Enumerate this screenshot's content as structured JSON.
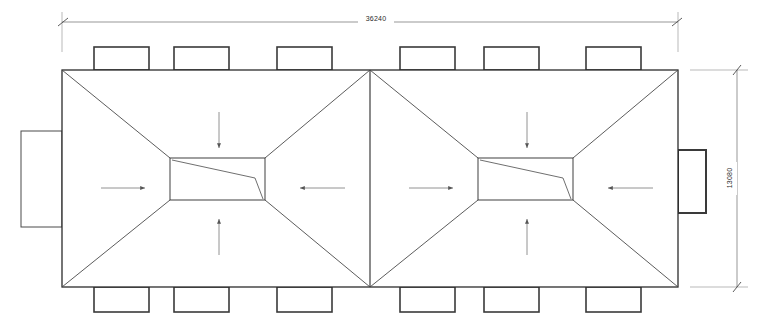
{
  "drawing": {
    "type": "architectural-roof-plan",
    "title": "Roof Plan",
    "line_color": "#2b2b2b",
    "heavy_line_color": "#3a3a3a",
    "background_color": "#ffffff",
    "dimensions": {
      "overall_width": {
        "value": "36240",
        "position": "top",
        "orientation": "horizontal"
      },
      "overall_height": {
        "value": "13080",
        "position": "right",
        "orientation": "vertical"
      }
    },
    "outline": {
      "x1": 62,
      "y1": 70,
      "x2": 678,
      "y2": 287
    },
    "center_valley_x": 370,
    "roof_sections": [
      {
        "name": "left-hip-roof",
        "outer": {
          "x1": 62,
          "y1": 70,
          "x2": 370,
          "y2": 287
        },
        "inner_flat": {
          "x1": 170,
          "y1": 158,
          "x2": 265,
          "y2": 200
        },
        "drain_line": {
          "x1": 172,
          "y1": 160,
          "x2": 255,
          "y2": 178,
          "x3": 263,
          "y3": 199
        }
      },
      {
        "name": "right-hip-roof",
        "outer": {
          "x1": 370,
          "y1": 70,
          "x2": 678,
          "y2": 287
        },
        "inner_flat": {
          "x1": 478,
          "y1": 158,
          "x2": 573,
          "y2": 200
        },
        "drain_line": {
          "x1": 480,
          "y1": 160,
          "x2": 563,
          "y2": 178,
          "x3": 571,
          "y3": 199
        }
      }
    ],
    "flow_arrows": [
      {
        "name": "arrow-left-section-down",
        "direction": "down",
        "x": 219,
        "y1": 112,
        "y2": 148
      },
      {
        "name": "arrow-left-section-up",
        "direction": "up",
        "x": 219,
        "y1": 255,
        "y2": 218
      },
      {
        "name": "arrow-left-section-right",
        "direction": "right",
        "x1": 101,
        "x2": 145,
        "y": 188
      },
      {
        "name": "arrow-left-section-left",
        "direction": "left",
        "x1": 345,
        "x2": 300,
        "y": 188
      },
      {
        "name": "arrow-right-section-down",
        "direction": "down",
        "x": 527,
        "y1": 112,
        "y2": 148
      },
      {
        "name": "arrow-right-section-up",
        "direction": "up",
        "x": 527,
        "y1": 255,
        "y2": 218
      },
      {
        "name": "arrow-right-section-right",
        "direction": "right",
        "x1": 409,
        "x2": 453,
        "y": 188
      },
      {
        "name": "arrow-right-section-left",
        "direction": "left",
        "x1": 653,
        "x2": 608,
        "y": 188
      }
    ],
    "top_units": [
      {
        "x": 94,
        "y": 47,
        "w": 55,
        "h": 23
      },
      {
        "x": 174,
        "y": 47,
        "w": 55,
        "h": 23
      },
      {
        "x": 277,
        "y": 47,
        "w": 55,
        "h": 23
      },
      {
        "x": 400,
        "y": 47,
        "w": 55,
        "h": 23
      },
      {
        "x": 484,
        "y": 47,
        "w": 55,
        "h": 23
      },
      {
        "x": 586,
        "y": 47,
        "w": 55,
        "h": 23
      }
    ],
    "bottom_units": [
      {
        "x": 94,
        "y": 287,
        "w": 55,
        "h": 25
      },
      {
        "x": 174,
        "y": 287,
        "w": 55,
        "h": 25
      },
      {
        "x": 277,
        "y": 287,
        "w": 55,
        "h": 25
      },
      {
        "x": 400,
        "y": 287,
        "w": 55,
        "h": 25
      },
      {
        "x": 484,
        "y": 287,
        "w": 55,
        "h": 25
      },
      {
        "x": 586,
        "y": 287,
        "w": 55,
        "h": 25
      }
    ],
    "side_units": [
      {
        "name": "left-side-unit",
        "x": 21,
        "y": 131,
        "w": 41,
        "h": 96,
        "heavy": false
      },
      {
        "name": "right-side-unit",
        "x": 678,
        "y": 150,
        "w": 28,
        "h": 63,
        "heavy": true
      }
    ]
  }
}
